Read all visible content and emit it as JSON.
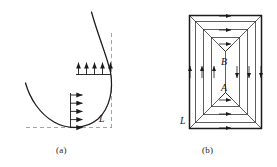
{
  "figure": {
    "type": "technical-diagram",
    "background_color": "#ffffff",
    "line_color": "#1a1a1a",
    "dashed_color": "#9a9a9a",
    "panels": [
      {
        "id": "a",
        "caption": "(a)",
        "labels": [
          {
            "name": "L",
            "text": "L",
            "x": 101,
            "y": 118
          }
        ],
        "curve": {
          "name": "arc-curve",
          "kind": "circular-arc",
          "stroke_width": 1.2
        },
        "dashed_lines": [
          {
            "name": "horizontal-datum",
            "orientation": "horizontal"
          },
          {
            "name": "vertical-datum",
            "orientation": "vertical"
          }
        ],
        "arrow_groups": [
          {
            "name": "vertical-load-arrows",
            "direction": "up",
            "count": 5,
            "baseline": "horizontal"
          },
          {
            "name": "horizontal-load-arrows",
            "direction": "right",
            "count": 5,
            "baseline": "vertical"
          }
        ]
      },
      {
        "id": "b",
        "caption": "(b)",
        "labels": [
          {
            "name": "A",
            "text": "A",
            "x": 226,
            "y": 88
          },
          {
            "name": "B",
            "text": "B",
            "x": 226,
            "y": 62
          },
          {
            "name": "L",
            "text": "L",
            "x": 183,
            "y": 121
          }
        ],
        "rectangle": {
          "name": "outer-boundary",
          "stroke_width": 1.6
        },
        "skeleton": {
          "name": "medial-axis",
          "kind": "hip-roof-diagonals",
          "note": "four corner diagonals meeting a central vertical ridge segment"
        },
        "contours": {
          "name": "offset-contours",
          "count": 3
        },
        "arrow_groups": [
          {
            "name": "top-horizontal-arrows",
            "direction": "right",
            "count": 3
          },
          {
            "name": "bottom-horizontal-arrows",
            "direction": "right",
            "count": 3
          },
          {
            "name": "left-vertical-arrows",
            "direction": "up",
            "count": 3
          },
          {
            "name": "right-vertical-arrows",
            "direction": "down",
            "count": 3
          }
        ]
      }
    ]
  }
}
